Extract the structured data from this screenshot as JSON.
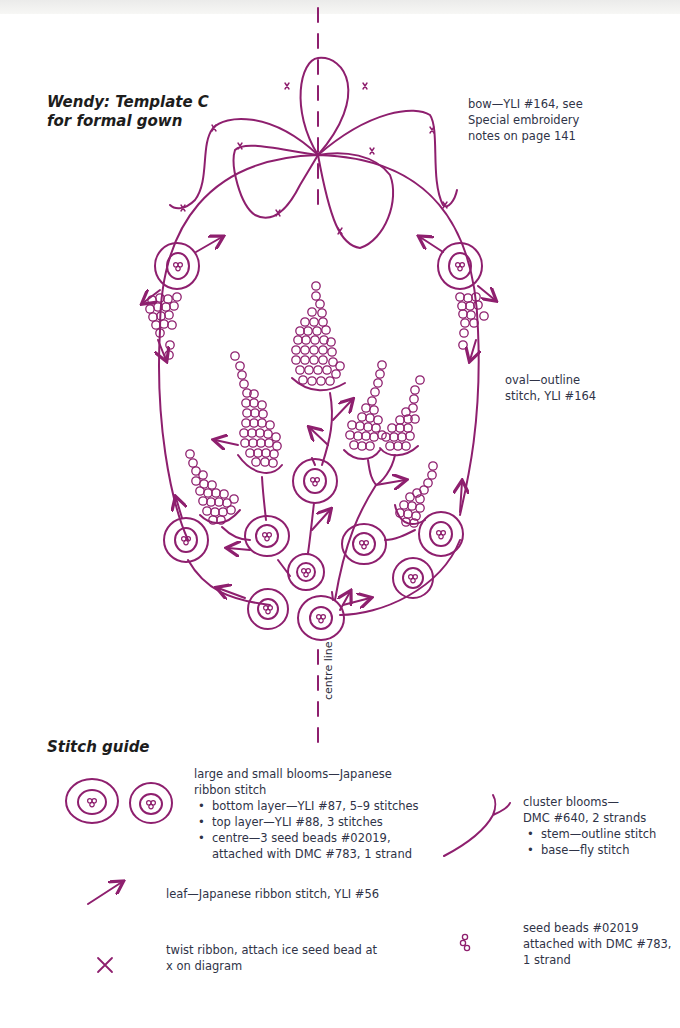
{
  "title": {
    "line1": "Wendy: Template C",
    "line2": "for formal gown"
  },
  "annotations": {
    "bow": [
      "bow—YLI #164, see",
      "Special embroidery",
      "notes on page 141"
    ],
    "oval": [
      "oval—outline",
      "stitch, YLI #164"
    ],
    "centre_line": "centre line"
  },
  "stitch_guide": {
    "heading": "Stitch guide",
    "blooms": {
      "line1": "large and small blooms—Japanese",
      "line2": "ribbon stitch",
      "bullets": [
        "bottom layer—YLI #87, 5–9 stitches",
        "top layer—YLI #88, 3 stitches",
        "centre—3 seed beads #02019,",
        "attached with DMC #783, 1 strand"
      ]
    },
    "cluster": {
      "line1": "cluster blooms—",
      "line2": "DMC #640, 2 strands",
      "bullets": [
        "stem—outline stitch",
        "base—fly stitch"
      ]
    },
    "leaf": "leaf—Japanese ribbon stitch, YLI #56",
    "twist": [
      "twist ribbon, attach ice seed bead at",
      "x on diagram"
    ],
    "seed": [
      "seed beads #02019",
      "attached with DMC #783,",
      "1 strand"
    ]
  },
  "colors": {
    "ink": "#8e1f6e",
    "text": "#2f3347"
  }
}
